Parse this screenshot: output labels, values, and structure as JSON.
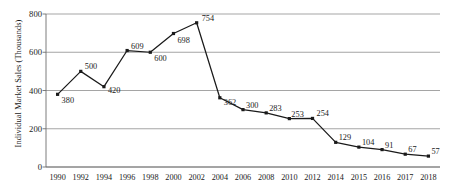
{
  "chart_data": {
    "type": "line",
    "title": "",
    "xlabel": "",
    "ylabel": "Individual Market Sales (Thousands)",
    "categories": [
      "1990",
      "1992",
      "1994",
      "1996",
      "1998",
      "2000",
      "2002",
      "2004",
      "2006",
      "2008",
      "2010",
      "2012",
      "2014",
      "2015",
      "2016",
      "2017",
      "2018"
    ],
    "values": [
      380,
      500,
      420,
      609,
      600,
      698,
      754,
      362,
      300,
      283,
      253,
      254,
      129,
      104,
      91,
      67,
      57
    ],
    "point_labels": [
      "380",
      "500",
      "420",
      "609",
      "600",
      "698",
      "754",
      "362",
      "300",
      "283",
      "253",
      "254",
      "129",
      "104",
      "91",
      "67",
      "57"
    ],
    "ylim": [
      0,
      800
    ],
    "yticks": [
      0,
      200,
      400,
      600,
      800
    ],
    "ytick_labels": [
      "0",
      "200",
      "400",
      "600",
      "800"
    ],
    "grid": true,
    "legend": "none",
    "series_color": "#1a1a1a",
    "grid_color": "#9b9b9b",
    "marker": "square"
  },
  "axes": {
    "y_title": "Individual Market Sales (Thousands)"
  }
}
